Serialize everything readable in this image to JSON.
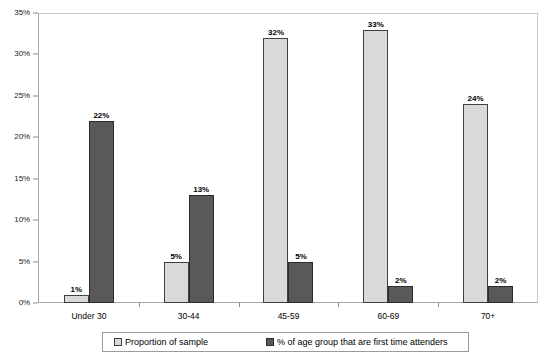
{
  "chart_data": {
    "type": "bar",
    "title": "",
    "subtitle": "",
    "xlabel": "",
    "ylabel": "",
    "ylim": [
      0,
      35
    ],
    "grid": false,
    "legend_position": "bottom",
    "y_ticks": [
      "0%",
      "5%",
      "10%",
      "15%",
      "20%",
      "25%",
      "30%",
      "35%"
    ],
    "y_tick_values": [
      0,
      5,
      10,
      15,
      20,
      25,
      30,
      35
    ],
    "categories": [
      "Under 30",
      "30-44",
      "45-59",
      "60-69",
      "70+"
    ],
    "series": [
      {
        "name": "Proportion of sample",
        "color": "#d9d9d9",
        "values": [
          1,
          5,
          32,
          33,
          24
        ],
        "labels": [
          "1%",
          "5%",
          "32%",
          "33%",
          "24%"
        ]
      },
      {
        "name": "% of age group that are first time attenders",
        "color": "#595959",
        "values": [
          22,
          13,
          5,
          2,
          2
        ],
        "labels": [
          "22%",
          "13%",
          "5%",
          "2%",
          "2%"
        ]
      }
    ]
  },
  "legend": {
    "items": [
      {
        "label": "Proportion of sample",
        "swatch": "light-gray-square-icon"
      },
      {
        "label": "% of age group that are first time attenders",
        "swatch": "dark-gray-square-icon"
      }
    ]
  },
  "colors": {
    "series_light": "#d9d9d9",
    "series_dark": "#595959",
    "bar_border": "#404040",
    "axis": "#a6a6a6",
    "frame": "#c9c9c9",
    "text": "#000000",
    "background": "#ffffff"
  }
}
